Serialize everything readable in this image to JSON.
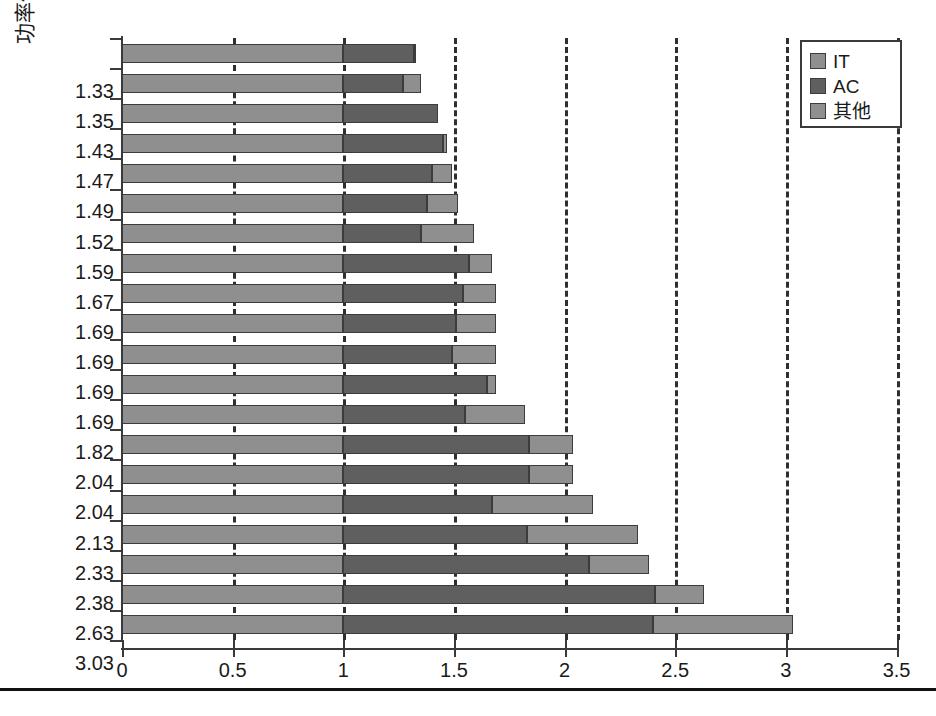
{
  "chart_data": {
    "type": "bar",
    "orientation": "horizontal",
    "stacked": true,
    "title": "",
    "xlabel": "",
    "ylabel": "功率使用有效性 (power usage effectiveness, PUE)",
    "xlim": [
      0,
      3.5
    ],
    "xticks": [
      "0",
      "0.5",
      "1",
      "1.5",
      "2",
      "2.5",
      "3",
      "3.5"
    ],
    "xtick_values": [
      0,
      0.5,
      1,
      1.5,
      2,
      2.5,
      3,
      3.5
    ],
    "grid": "vertical-dashed",
    "legend_position": "top-right",
    "categories": [
      "1.33",
      "1.35",
      "1.43",
      "1.47",
      "1.49",
      "1.52",
      "1.59",
      "1.67",
      "1.69",
      "1.69",
      "1.69",
      "1.69",
      "1.82",
      "2.04",
      "2.04",
      "2.13",
      "2.33",
      "2.38",
      "2.63",
      "3.03"
    ],
    "series": [
      {
        "name": "IT",
        "color": "#8f8f8f",
        "values": [
          1.0,
          1.0,
          1.0,
          1.0,
          1.0,
          1.0,
          1.0,
          1.0,
          1.0,
          1.0,
          1.0,
          1.0,
          1.0,
          1.0,
          1.0,
          1.0,
          1.0,
          1.0,
          1.0,
          1.0
        ]
      },
      {
        "name": "AC",
        "color": "#5f5f5f",
        "values": [
          0.32,
          0.27,
          0.43,
          0.45,
          0.4,
          0.38,
          0.35,
          0.57,
          0.54,
          0.51,
          0.49,
          0.65,
          0.55,
          0.84,
          0.84,
          0.67,
          0.83,
          1.11,
          1.41,
          1.4
        ]
      },
      {
        "name": "其他",
        "color": "#8f8f8f",
        "values": [
          0.01,
          0.08,
          0.0,
          0.02,
          0.09,
          0.14,
          0.24,
          0.1,
          0.15,
          0.18,
          0.2,
          0.04,
          0.27,
          0.2,
          0.2,
          0.46,
          0.5,
          0.27,
          0.22,
          0.63
        ]
      }
    ],
    "totals": [
      1.33,
      1.35,
      1.43,
      1.47,
      1.49,
      1.52,
      1.59,
      1.67,
      1.69,
      1.69,
      1.69,
      1.69,
      1.82,
      2.04,
      2.04,
      2.13,
      2.33,
      2.38,
      2.63,
      3.03
    ]
  },
  "legend": {
    "items": [
      {
        "label": "IT",
        "color": "#8f8f8f"
      },
      {
        "label": "AC",
        "color": "#5f5f5f"
      },
      {
        "label": "其他",
        "color": "#8f8f8f"
      }
    ]
  },
  "axis": {
    "y_title": "功率使用有效性 (power usage effectiveness, PUE)"
  },
  "caption": ""
}
